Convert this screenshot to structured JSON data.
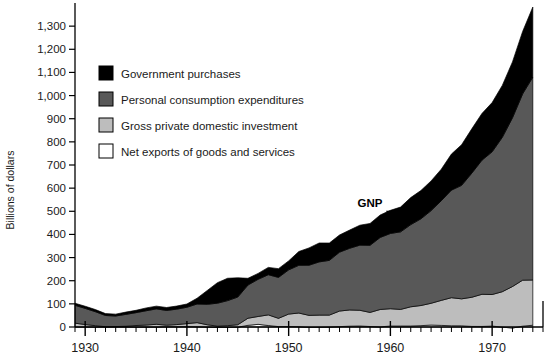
{
  "chart_data": {
    "type": "area",
    "stacked": true,
    "title": "",
    "xlabel": "",
    "ylabel": "Billions of dollars",
    "xlim": [
      1929,
      1975
    ],
    "ylim": [
      0,
      1400
    ],
    "ytick_labels": [
      "0",
      "100",
      "200",
      "300",
      "400",
      "500",
      "600",
      "700",
      "800",
      "900",
      "1,000",
      "1,100",
      "1,200",
      "1,300"
    ],
    "ytick_values": [
      0,
      100,
      200,
      300,
      400,
      500,
      600,
      700,
      800,
      900,
      1000,
      1100,
      1200,
      1300
    ],
    "xtick_labels": [
      "1930",
      "1940",
      "1950",
      "1960",
      "1970"
    ],
    "xtick_values": [
      1930,
      1940,
      1950,
      1960,
      1970
    ],
    "minor_tick_interval": 1,
    "grid": false,
    "legend_position": "upper-left-inside",
    "annotations": [
      {
        "text": "GNP",
        "x": 1958,
        "y": 520,
        "pointer": "arrow-down-right"
      }
    ],
    "series": [
      {
        "name": "Net exports of goods and services",
        "color": "#ffffff",
        "legend_label": "Net exports of goods and services",
        "values": [
          0.4,
          0.3,
          0.2,
          0.2,
          0.4,
          0.4,
          0.1,
          0.1,
          0.1,
          1.1,
          1.1,
          1.5,
          1.0,
          -0.2,
          -2.2,
          -1.4,
          -0.8,
          7.2,
          11.5,
          6.4,
          1.8,
          1.8,
          1.1,
          -1.6,
          -1.2,
          -0.2,
          1.6,
          3.6,
          4.4,
          2.1,
          0.5,
          4.2,
          4.3,
          4.3,
          5.8,
          8.5,
          6.9,
          5.2,
          5.1,
          2.5,
          2.4,
          4.0,
          -0.7,
          -4.4,
          3.7,
          7.6
        ]
      },
      {
        "name": "Gross private domestic investment",
        "color": "#bdbdbd",
        "legend_label": "Gross private domestic investment",
        "values": [
          16.2,
          10.3,
          5.5,
          0.9,
          1.4,
          2.9,
          6.3,
          8.4,
          11.7,
          6.7,
          9.3,
          13.1,
          17.9,
          9.9,
          5.8,
          7.2,
          10.6,
          30.7,
          34.0,
          46.0,
          35.7,
          54.1,
          59.3,
          51.9,
          52.6,
          51.7,
          67.4,
          70.0,
          67.9,
          60.9,
          75.3,
          74.8,
          71.7,
          83.0,
          87.1,
          94.0,
          108.1,
          121.4,
          116.6,
          126.0,
          139.0,
          136.3,
          153.2,
          179.3,
          198.6,
          195.5
        ]
      },
      {
        "name": "Personal consumption expenditures",
        "color": "#585858",
        "legend_label": "Personal consumption expenditures",
        "values": [
          77.2,
          69.9,
          60.5,
          48.6,
          45.8,
          51.3,
          55.7,
          61.9,
          66.5,
          63.9,
          66.8,
          70.8,
          80.6,
          88.5,
          99.3,
          108.3,
          119.7,
          143.4,
          160.7,
          173.6,
          176.8,
          191.0,
          206.3,
          216.7,
          230.0,
          236.5,
          254.4,
          266.7,
          281.4,
          290.1,
          311.2,
          325.2,
          335.2,
          355.1,
          374.6,
          400.4,
          430.4,
          464.8,
          490.4,
          536.2,
          579.5,
          616.7,
          667.2,
          729.0,
          805.2,
          876.7
        ]
      },
      {
        "name": "Government purchases",
        "color": "#000000",
        "legend_label": "Government purchases",
        "values": [
          8.8,
          9.2,
          9.2,
          8.1,
          8.0,
          9.8,
          10.0,
          12.0,
          11.9,
          12.5,
          13.3,
          14.0,
          24.8,
          59.6,
          88.6,
          96.5,
          83.0,
          29.1,
          25.5,
          31.6,
          37.8,
          38.8,
          59.4,
          74.7,
          81.6,
          74.8,
          74.2,
          78.6,
          86.1,
          94.2,
          97.0,
          99.8,
          107.0,
          116.8,
          122.3,
          128.3,
          136.3,
          155.9,
          175.6,
          191.5,
          201.8,
          212.7,
          224.3,
          241.5,
          269.5,
          302.7
        ]
      }
    ]
  },
  "legend": {
    "items": [
      {
        "label": "Government purchases",
        "color": "#000000"
      },
      {
        "label": "Personal consumption expenditures",
        "color": "#585858"
      },
      {
        "label": "Gross private domestic investment",
        "color": "#bdbdbd"
      },
      {
        "label": "Net exports of goods and services",
        "color": "#ffffff"
      }
    ]
  },
  "axis": {
    "y_title": "Billions of dollars"
  }
}
